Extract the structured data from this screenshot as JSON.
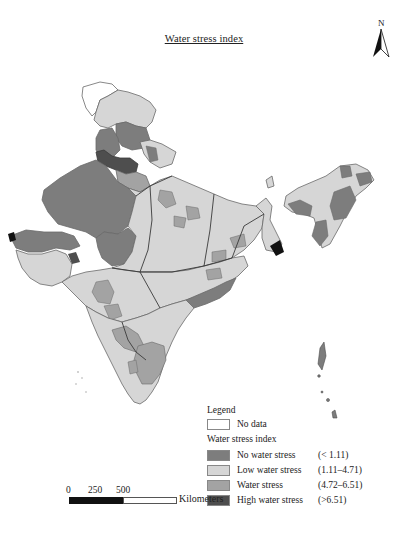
{
  "title": "Water stress index",
  "north_arrow": {
    "label": "N",
    "icon": "north-arrow-icon"
  },
  "legend": {
    "heading": "Legend",
    "no_data": {
      "label": "No data",
      "color": "#ffffff"
    },
    "subheading": "Water stress index",
    "classes": [
      {
        "label": "No water stress",
        "range": "(< 1.11)",
        "color": "#7d7d7d"
      },
      {
        "label": "Low water stress",
        "range": "(1.11–4.71)",
        "color": "#d6d6d6"
      },
      {
        "label": "Water stress",
        "range": "(4.72–6.51)",
        "color": "#a3a3a3"
      },
      {
        "label": "High water stress",
        "range": "(>6.51)",
        "color": "#4e4e4e"
      }
    ]
  },
  "scale_bar": {
    "ticks": [
      "0",
      "250",
      "500"
    ],
    "unit": "Kilometers"
  },
  "colors": {
    "no_data": "#ffffff",
    "no_stress": "#7d7d7d",
    "low_stress": "#d6d6d6",
    "stress": "#a3a3a3",
    "high_stress": "#4e4e4e",
    "boundary": "#6a6a6a",
    "state_boundary": "#3a3a3a"
  }
}
